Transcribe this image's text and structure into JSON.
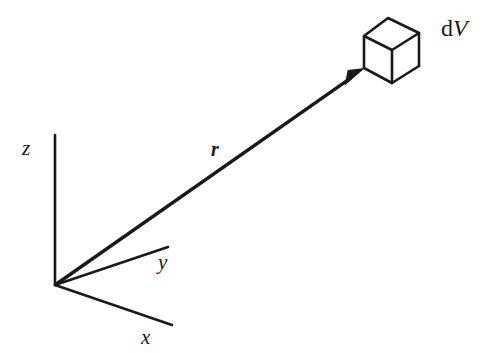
{
  "figure": {
    "background_color": "#ffffff",
    "stroke_color": "#1a1a1a",
    "width": 493,
    "height": 353
  },
  "labels": {
    "z_axis": "z",
    "y_axis": "y",
    "x_axis": "x",
    "vector_r": "r",
    "volume_element_prefix": "d",
    "volume_element_symbol": "V"
  },
  "geometry": {
    "origin": {
      "x": 55,
      "y": 285
    },
    "axes": [
      {
        "name": "z",
        "from": [
          55,
          285
        ],
        "to": [
          55,
          135
        ],
        "stroke_width": 2.6
      },
      {
        "name": "y",
        "from": [
          55,
          285
        ],
        "to": [
          168,
          247
        ],
        "stroke_width": 2.6
      },
      {
        "name": "x",
        "from": [
          55,
          285
        ],
        "to": [
          172,
          325
        ],
        "stroke_width": 2.6
      }
    ],
    "vector": {
      "name": "r",
      "from": [
        55,
        285
      ],
      "to": [
        365,
        68
      ],
      "stroke_width": 3.4,
      "arrowhead_length": 24,
      "arrowhead_width": 13
    },
    "cube": {
      "top_back": [
        388,
        18
      ],
      "top_left": [
        364,
        36
      ],
      "top_right": [
        419,
        33
      ],
      "top_front": [
        392,
        50
      ],
      "bottom_left": [
        364,
        68
      ],
      "bottom_front": [
        392,
        83
      ],
      "bottom_right": [
        419,
        66
      ],
      "stroke_width": 2.6
    }
  }
}
